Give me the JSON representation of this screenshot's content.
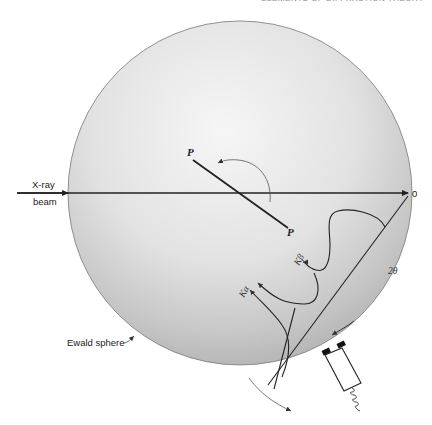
{
  "header": {
    "running_title": "ELEMENTS OF DIFFRACTION THEORY"
  },
  "labels": {
    "xray_line1": "X-ray",
    "xray_line2": "beam",
    "origin": "0",
    "plane_top": "P",
    "plane_bottom": "P",
    "k_beta": "Kβ",
    "k_alpha": "Kα",
    "two_theta": "2θ",
    "ewald": "Ewald sphere"
  },
  "colors": {
    "sphere_center": "#f4f4f4",
    "sphere_edge": "#b9b9b9",
    "line": "#222222"
  }
}
